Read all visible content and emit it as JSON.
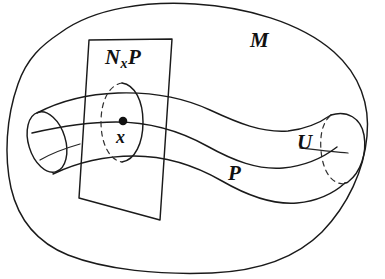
{
  "figure": {
    "type": "mathematical-diagram",
    "width": 385,
    "height": 279,
    "background_color": "#ffffff",
    "ink_color": "#1a1a1a"
  },
  "labels": {
    "ambient_manifold": "M",
    "normal_space_prefix": "N",
    "normal_space_subscript": "x",
    "normal_space_suffix": "P",
    "point": "x",
    "submanifold": "P",
    "neighborhood": "U"
  },
  "elements": {
    "outer_blob_name": "ambient manifold boundary",
    "tube_name": "tubular neighborhood",
    "plane_name": "normal space plane",
    "ellipse_name": "normal slice ellipse",
    "dot_name": "base point marker",
    "curve_name": "submanifold curve"
  }
}
